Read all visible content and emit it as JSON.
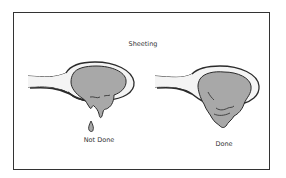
{
  "diagram": {
    "title": "Sheeting",
    "panels": [
      {
        "label": "Not Done",
        "state": "drips-separately"
      },
      {
        "label": "Done",
        "state": "sheets-off-spoon"
      }
    ],
    "colors": {
      "frame": "#333333",
      "outline": "#2b2b2b",
      "liquid_fill": "#a8a8a8",
      "spoon_fill": "#ffffff"
    }
  }
}
